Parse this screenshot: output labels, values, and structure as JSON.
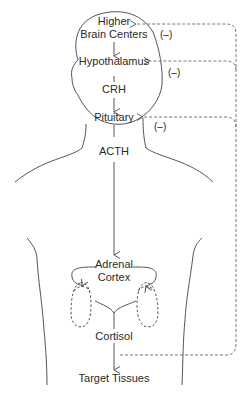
{
  "diagram": {
    "nodes": {
      "higher_brain_centers": {
        "line1": "Higher",
        "line2": "Brain Centers"
      },
      "hypothalamus": "Hypothalamus",
      "crh": "CRH",
      "pituitary": "Pituitary",
      "acth": "ACTH",
      "adrenal_cortex": {
        "line1": "Adrenal",
        "line2": "Cortex"
      },
      "cortisol": "Cortisol",
      "target_tissues": "Target Tissues"
    },
    "feedback": {
      "label_brain": "(–)",
      "label_hypothalamus": "(–)",
      "label_pituitary": "(–)"
    },
    "colors": {
      "line": "#555555",
      "dashed": "#777777",
      "text": "#2a2a2a"
    }
  }
}
